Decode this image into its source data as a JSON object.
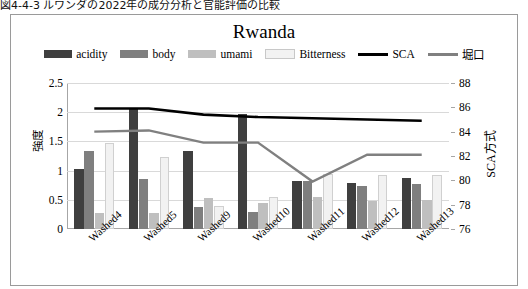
{
  "top_caption": "図4-4-3 ルワンダの2022年の成分分析と官能評価の比較",
  "chart": {
    "title": "Rwanda",
    "legend": [
      {
        "label": "acidity",
        "type": "swatch",
        "color": "#3f3f3f"
      },
      {
        "label": "body",
        "type": "swatch",
        "color": "#7f7f7f"
      },
      {
        "label": "umami",
        "type": "swatch",
        "color": "#bfbfbf"
      },
      {
        "label": "Bitterness",
        "type": "swatch",
        "color": "#f2f2f2"
      },
      {
        "label": "SCA",
        "type": "line",
        "color": "#000000"
      },
      {
        "label": "堀口",
        "type": "line",
        "color": "#808080"
      }
    ],
    "y_left": {
      "label": "強度",
      "min": 0,
      "max": 2.5,
      "step": 0.5,
      "ticks": [
        "0",
        "0.5",
        "1",
        "1.5",
        "2",
        "2.5"
      ]
    },
    "y_right": {
      "label": "SCA方式",
      "min": 76,
      "max": 88,
      "step": 2,
      "ticks": [
        "76",
        "78",
        "80",
        "82",
        "84",
        "86",
        "88"
      ]
    }
  },
  "chart_data": {
    "type": "bar",
    "title": "Rwanda",
    "xlabel": "",
    "ylabel": "強度",
    "ylabel_secondary": "SCA方式",
    "ylim": [
      0,
      2.5
    ],
    "ylim_secondary": [
      76,
      88
    ],
    "grid": true,
    "legend_position": "top",
    "categories": [
      "Washed4",
      "Washed5",
      "Washed9",
      "Washed10",
      "Washed11",
      "Washed12",
      "Washed13"
    ],
    "series": [
      {
        "name": "acidity",
        "type": "bar",
        "axis": "left",
        "color": "#3f3f3f",
        "values": [
          1.03,
          2.05,
          1.33,
          1.97,
          0.83,
          0.78,
          0.87
        ]
      },
      {
        "name": "body",
        "type": "bar",
        "axis": "left",
        "color": "#7f7f7f",
        "values": [
          1.33,
          0.85,
          0.37,
          0.29,
          0.82,
          0.73,
          0.77
        ]
      },
      {
        "name": "umami",
        "type": "bar",
        "axis": "left",
        "color": "#bfbfbf",
        "values": [
          0.27,
          0.27,
          0.53,
          0.45,
          0.55,
          0.48,
          0.5
        ]
      },
      {
        "name": "Bitterness",
        "type": "bar",
        "axis": "left",
        "color": "#f2f2f2",
        "values": [
          1.47,
          1.23,
          0.4,
          0.55,
          0.95,
          0.93,
          0.93
        ]
      },
      {
        "name": "SCA",
        "type": "line",
        "axis": "right",
        "color": "#000000",
        "values": [
          85.9,
          85.9,
          85.4,
          85.2,
          85.1,
          85.0,
          84.9
        ]
      },
      {
        "name": "堀口",
        "type": "line",
        "axis": "right",
        "color": "#808080",
        "values": [
          84.0,
          84.1,
          83.1,
          83.1,
          79.9,
          82.1,
          82.1
        ]
      }
    ]
  }
}
